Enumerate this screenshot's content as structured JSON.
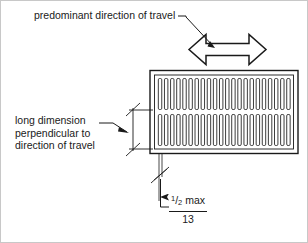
{
  "figure": {
    "background_color": "#ffffff",
    "line_color": "#1a1a1a",
    "border_color": "#c8c8c8"
  },
  "annotations": {
    "top_label": "predominant direction of travel",
    "left_label_line1": "long dimension",
    "left_label_line2": "perpendicular to",
    "left_label_line3": "direction of travel"
  },
  "dimension": {
    "numerator": "1",
    "slash": "/",
    "denominator": "2",
    "unit_note": "max",
    "metric_value": "13"
  },
  "grating": {
    "slot_count_per_row": 22,
    "row_count": 2
  },
  "icons": {
    "double_arrow": "double-headed-horizontal-arrow",
    "tick_mark": "architectural-slash-tick",
    "leader_arrowhead": "solid-arrowhead"
  }
}
